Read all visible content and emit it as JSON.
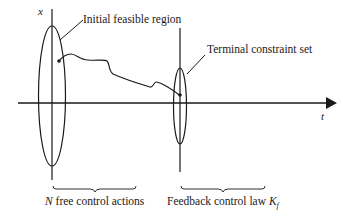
{
  "diagram": {
    "axes": {
      "y_label": "x",
      "x_label": "t"
    },
    "labels": {
      "initial_region": "Initial feasible region",
      "terminal_set": "Terminal constraint set",
      "free_actions_var": "N",
      "free_actions_text": " free control actions",
      "feedback_text": "Feedback control law ",
      "feedback_var": "K",
      "feedback_sub": "f"
    },
    "colors": {
      "stroke": "#1a1a1a",
      "background": "#ffffff"
    }
  }
}
